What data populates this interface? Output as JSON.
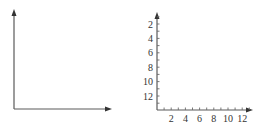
{
  "chart_data": [
    {
      "type": "scatter",
      "title": "",
      "xlabel": "",
      "ylabel": "",
      "grid": false,
      "ticks": false,
      "series": [],
      "description": "Blank coordinate axes with arrows, no tick labels"
    },
    {
      "type": "scatter",
      "title": "",
      "xlabel": "",
      "ylabel": "",
      "grid": false,
      "xlim": [
        0,
        13
      ],
      "ylim": [
        0,
        13
      ],
      "x_tick_labels": [
        "2",
        "4",
        "6",
        "8",
        "10",
        "12"
      ],
      "y_tick_labels": [
        "2",
        "4",
        "6",
        "8",
        "10",
        "12"
      ],
      "y_axis_inverted": true,
      "minor_ticks_every": 1,
      "series": []
    }
  ],
  "colors": {
    "axis": "#555555",
    "text": "#333333"
  }
}
